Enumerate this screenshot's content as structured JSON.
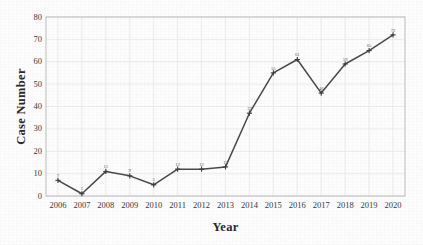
{
  "chart_data": {
    "type": "line",
    "title": "",
    "xlabel": "Year",
    "ylabel": "Case Number",
    "categories": [
      "2006",
      "2007",
      "2008",
      "2009",
      "2010",
      "2011",
      "2012",
      "2013",
      "2014",
      "2015",
      "2016",
      "2017",
      "2018",
      "2019",
      "2020"
    ],
    "values": [
      7,
      1,
      11,
      9,
      5,
      12,
      12,
      13,
      37,
      55,
      61,
      46,
      59,
      65,
      72
    ],
    "point_labels": [
      "7",
      "1",
      "11",
      "9",
      "5",
      "12",
      "12",
      "13",
      "37",
      "55",
      "61",
      "46",
      "59",
      "65",
      "72"
    ],
    "series": [
      {
        "name": "Case Number",
        "values": [
          7,
          1,
          11,
          9,
          5,
          12,
          12,
          13,
          37,
          55,
          61,
          46,
          59,
          65,
          72
        ]
      }
    ],
    "xlim": [
      "2006",
      "2020"
    ],
    "ylim": [
      0,
      80
    ],
    "yticks": [
      0,
      10,
      20,
      30,
      40,
      50,
      60,
      70,
      80
    ],
    "ytick_labels": [
      "0",
      "10",
      "20",
      "30",
      "40",
      "50",
      "60",
      "70",
      "80"
    ],
    "xticks": [
      "2006",
      "2007",
      "2008",
      "2009",
      "2010",
      "2011",
      "2012",
      "2013",
      "2014",
      "2015",
      "2016",
      "2017",
      "2018",
      "2019",
      "2020"
    ],
    "grid": true,
    "grid_color": "#e9e9e9",
    "legend": null,
    "legend_position": "none",
    "line_color": "#4a4a4a",
    "marker": "plus",
    "marker_color": "#3c3c3c",
    "background_color": "#fdfdfd",
    "frame_color": "#bdbdbd"
  }
}
